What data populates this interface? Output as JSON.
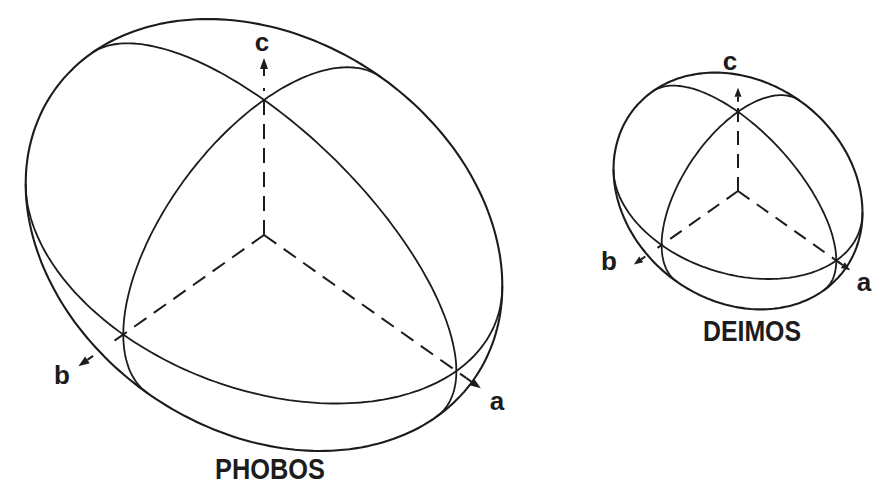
{
  "figures": {
    "phobos": {
      "name": "PHOBOS",
      "axis_labels": {
        "a": "a",
        "b": "b",
        "c": "c"
      }
    },
    "deimos": {
      "name": "DEIMOS",
      "axis_labels": {
        "a": "a",
        "b": "b",
        "c": "c"
      }
    }
  },
  "colors": {
    "ink": "#1c1c1c",
    "paper": "#ffffff"
  }
}
